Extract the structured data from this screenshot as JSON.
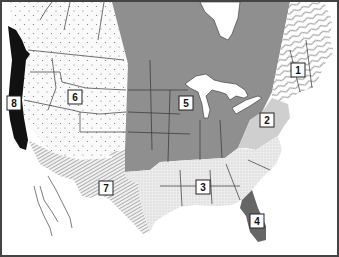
{
  "map": {
    "title": "",
    "width": 339,
    "height": 257,
    "colors": {
      "frame": "#444444",
      "background": "#ffffff",
      "region_5_fill": "#8f8f8f",
      "region_8_fill": "#111111",
      "region_4_fill": "#666666",
      "region_2_fill": "#cfcfcf",
      "region_3_fill": "#e9e9e9",
      "region_6_fill": "#f7f7f7",
      "region_7_fill": "#d8d8d8",
      "region_1_fill": "#ffffff"
    },
    "regions": [
      {
        "id": "1",
        "label": "1",
        "pattern": "wavy-hatch",
        "x": 298,
        "y": 70
      },
      {
        "id": "2",
        "label": "2",
        "pattern": "light-gray",
        "x": 267,
        "y": 120
      },
      {
        "id": "3",
        "label": "3",
        "pattern": "fine-stipple",
        "x": 203,
        "y": 187
      },
      {
        "id": "4",
        "label": "4",
        "pattern": "dark-gray",
        "x": 257,
        "y": 221
      },
      {
        "id": "5",
        "label": "5",
        "pattern": "medium-gray",
        "x": 186,
        "y": 103
      },
      {
        "id": "6",
        "label": "6",
        "pattern": "sparse-dots",
        "x": 75,
        "y": 97
      },
      {
        "id": "7",
        "label": "7",
        "pattern": "diagonal-hatch",
        "x": 106,
        "y": 188
      },
      {
        "id": "8",
        "label": "8",
        "pattern": "solid-black",
        "x": 14,
        "y": 103
      }
    ]
  }
}
